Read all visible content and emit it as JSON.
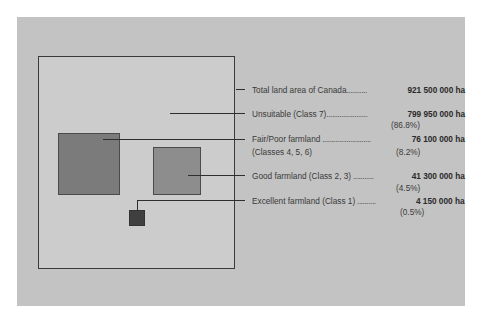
{
  "figure": {
    "colors": {
      "panel": "#c3c3c3",
      "land_box": "#cccccc",
      "fair_poor": "#7b7b7b",
      "good": "#8d8d8d",
      "excellent": "#3f3f3f"
    },
    "total": {
      "label": "Total land area of Canada",
      "leader": "...........",
      "value": "921 500 000 ha"
    },
    "categories": [
      {
        "id": "unsuitable",
        "label": "Unsuitable (Class 7)",
        "label_line2": "",
        "leader": "......................",
        "value": "799 950 000 ha",
        "percent": "(86.8%)"
      },
      {
        "id": "fair-poor",
        "label": "Fair/Poor farmland",
        "label_line2": "(Classes 4, 5, 6)",
        "leader": " ..........................",
        "value": "76 100 000 ha",
        "percent": "(8.2%)"
      },
      {
        "id": "good",
        "label": "Good farmland (Class 2, 3)",
        "label_line2": "",
        "leader": " ...........",
        "value": "41 300 000 ha",
        "percent": "(4.5%)"
      },
      {
        "id": "excellent",
        "label": "Excellent farmland (Class 1)",
        "label_line2": "",
        "leader": " ..........",
        "value": "4 150 000 ha",
        "percent": "(0.5%)"
      }
    ]
  }
}
